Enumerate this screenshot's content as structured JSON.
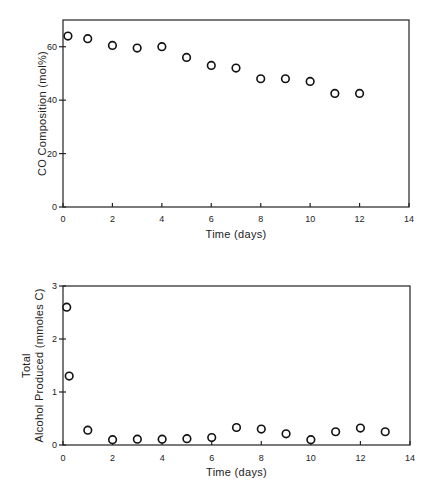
{
  "chart_data": [
    {
      "type": "scatter",
      "title": "",
      "xlabel": "Time (days)",
      "ylabel": "CO Composition (mol%)",
      "xlim": [
        0,
        14
      ],
      "ylim": [
        0,
        70
      ],
      "xticks": [
        0,
        2,
        4,
        6,
        8,
        10,
        12,
        14
      ],
      "yticks": [
        0,
        20,
        40,
        60
      ],
      "grid": false,
      "legend": null,
      "series": [
        {
          "name": "CO Composition",
          "marker": "open-circle",
          "x": [
            0.2,
            1,
            2,
            3,
            4,
            5,
            6,
            7,
            8,
            9,
            10,
            11,
            12
          ],
          "y": [
            64,
            63,
            60.5,
            59.5,
            60,
            56,
            53,
            52,
            48,
            48,
            47,
            42.5,
            42.5
          ]
        }
      ]
    },
    {
      "type": "scatter",
      "title": "",
      "xlabel": "Time (days)",
      "ylabel_lines": [
        "Total",
        "Alcohol Produced (mmoles C)"
      ],
      "ylabel": "Total Alcohol Produced (mmoles C)",
      "xlim": [
        0,
        14
      ],
      "ylim": [
        0,
        3
      ],
      "xticks": [
        0,
        2,
        4,
        6,
        8,
        10,
        12,
        14
      ],
      "yticks": [
        0,
        1,
        2,
        3
      ],
      "grid": false,
      "legend": null,
      "series": [
        {
          "name": "Total Alcohol Produced",
          "marker": "open-circle",
          "x": [
            0.15,
            0.25,
            1,
            2,
            3,
            4,
            5,
            6,
            7,
            8,
            9,
            10,
            11,
            12,
            13
          ],
          "y": [
            2.6,
            1.3,
            0.28,
            0.1,
            0.11,
            0.11,
            0.12,
            0.14,
            0.33,
            0.3,
            0.21,
            0.1,
            0.25,
            0.32,
            0.25
          ]
        }
      ]
    }
  ]
}
